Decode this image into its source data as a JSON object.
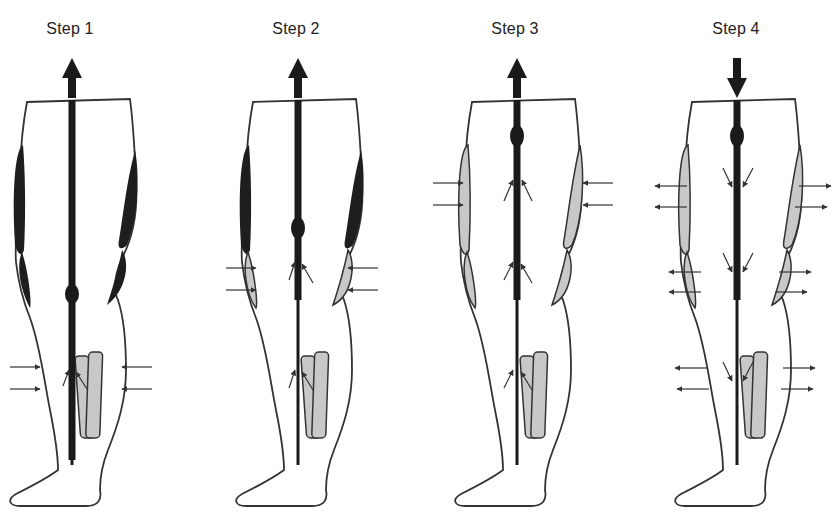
{
  "figure": {
    "colors": {
      "outline": "#333333",
      "vein": "#1a1a1a",
      "inflated_cuff": "#1e1e1e",
      "deflated_cuff": "#c8c8c8",
      "arrow": "#333333",
      "background": "#ffffff"
    }
  },
  "steps": [
    {
      "label": "Step 1",
      "flow_direction": "up",
      "cuff_states": {
        "thigh": "inflated",
        "knee": "inflated",
        "calf": "compressing"
      },
      "compression_arrows": "inward-calf",
      "vein_bulge": "knee"
    },
    {
      "label": "Step 2",
      "flow_direction": "up",
      "cuff_states": {
        "thigh": "inflated",
        "knee": "compressing",
        "calf": "deflated"
      },
      "compression_arrows": "inward-knee",
      "vein_bulge": "mid-thigh"
    },
    {
      "label": "Step 3",
      "flow_direction": "up",
      "cuff_states": {
        "thigh": "compressing",
        "knee": "deflated",
        "calf": "deflated"
      },
      "compression_arrows": "inward-thigh",
      "vein_bulge": "upper-thigh"
    },
    {
      "label": "Step 4",
      "flow_direction": "down",
      "cuff_states": {
        "thigh": "deflated",
        "knee": "deflated",
        "calf": "deflated"
      },
      "compression_arrows": "outward-all",
      "vein_bulge": "upper-thigh"
    }
  ]
}
